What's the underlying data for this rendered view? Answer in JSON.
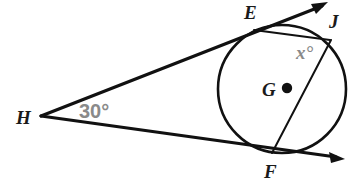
{
  "figure": {
    "background_color": "#ffffff",
    "stroke_color": "#111111",
    "label_color": "#1a1a1a",
    "measure_color": "#8a8a8a",
    "width": 350,
    "height": 189
  },
  "labels": {
    "point_e": "E",
    "point_j": "J",
    "point_g": "G",
    "point_f": "F",
    "point_h": "H",
    "angle_h": "30°",
    "angle_x": "x°"
  },
  "geometry": {
    "circle": {
      "center_x": 282,
      "center_y": 89,
      "radius": 64,
      "center_label": "G"
    },
    "points": {
      "E": {
        "x": 256,
        "y": 30,
        "label": "E",
        "role": "tangent-point"
      },
      "J": {
        "x": 329,
        "y": 39,
        "label": "J",
        "role": "circle-point"
      },
      "F": {
        "x": 274,
        "y": 152,
        "label": "F",
        "role": "tangent-point"
      },
      "H": {
        "x": 41,
        "y": 116,
        "label": "H",
        "role": "external-vertex"
      },
      "G": {
        "x": 285,
        "y": 88,
        "label": "G",
        "role": "center"
      }
    },
    "segments": [
      {
        "name": "tangent-HE",
        "from": "H",
        "to": "E",
        "extends_to": [
          326,
          3
        ],
        "has_arrow": true
      },
      {
        "name": "tangent-HF",
        "from": "H",
        "to": "F",
        "extends_to": [
          344,
          159
        ],
        "has_arrow": true
      },
      {
        "name": "chord-EJ",
        "from": "E",
        "to": "J",
        "has_arrow": false
      },
      {
        "name": "chord-FJ",
        "from": "F",
        "to": "J",
        "has_arrow": false
      }
    ],
    "measures": [
      {
        "name": "angle-at-H",
        "value": "30°",
        "at": "H"
      },
      {
        "name": "angle-at-J",
        "value": "x°",
        "at": "J"
      }
    ]
  }
}
